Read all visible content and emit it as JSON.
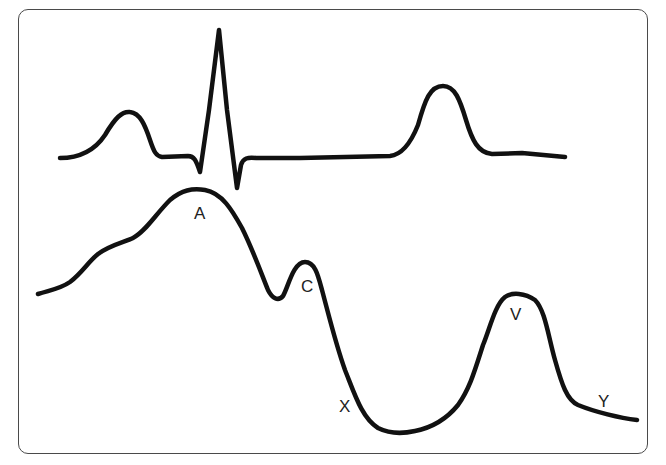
{
  "figure": {
    "colors": {
      "trace": "#111111",
      "frame": "#4a4a4a",
      "label": "#222222",
      "background": "#ffffff"
    },
    "ecg": {
      "components": [
        "P wave",
        "QRS complex",
        "T wave"
      ]
    },
    "jvp": {
      "labels": {
        "a": "A",
        "c": "C",
        "x": "X",
        "v": "V",
        "y": "Y"
      }
    }
  }
}
